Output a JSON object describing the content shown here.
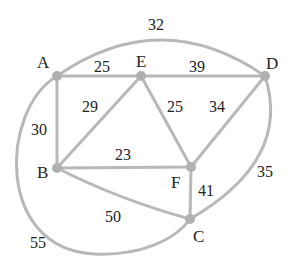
{
  "graph": {
    "title": "",
    "nodes": [
      {
        "id": "A",
        "label": "A",
        "x": 57,
        "y": 76
      },
      {
        "id": "E",
        "label": "E",
        "x": 141,
        "y": 76
      },
      {
        "id": "D",
        "label": "D",
        "x": 265,
        "y": 76
      },
      {
        "id": "B",
        "label": "B",
        "x": 57,
        "y": 168
      },
      {
        "id": "F",
        "label": "F",
        "x": 191,
        "y": 167
      },
      {
        "id": "C",
        "label": "C",
        "x": 190,
        "y": 219
      }
    ],
    "edges": [
      {
        "from": "A",
        "to": "E",
        "weight": "25"
      },
      {
        "from": "E",
        "to": "D",
        "weight": "39"
      },
      {
        "from": "A",
        "to": "D",
        "weight": "32"
      },
      {
        "from": "A",
        "to": "B",
        "weight": "30"
      },
      {
        "from": "B",
        "to": "E",
        "weight": "29"
      },
      {
        "from": "E",
        "to": "F",
        "weight": "25"
      },
      {
        "from": "D",
        "to": "F",
        "weight": "34"
      },
      {
        "from": "B",
        "to": "F",
        "weight": "23"
      },
      {
        "from": "F",
        "to": "C",
        "weight": "41"
      },
      {
        "from": "D",
        "to": "C",
        "weight": "35"
      },
      {
        "from": "B",
        "to": "C",
        "weight": "50"
      },
      {
        "from": "A",
        "to": "C",
        "weight": "55"
      }
    ]
  },
  "labels": {
    "A": "A",
    "E": "E",
    "D": "D",
    "B": "B",
    "F": "F",
    "C": "C"
  },
  "weights": {
    "AE": "25",
    "ED": "39",
    "AD": "32",
    "AB": "30",
    "BE": "29",
    "EF": "25",
    "DF": "34",
    "BF": "23",
    "FC": "41",
    "DC": "35",
    "BC": "50",
    "AC": "55"
  },
  "colors": {
    "edge": "#b8b8b8",
    "node": "#b0b0b0",
    "text": "#222222"
  }
}
